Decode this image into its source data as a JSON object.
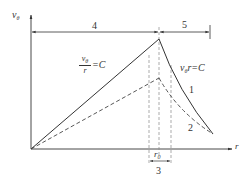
{
  "diagram": {
    "axes": {
      "y_label": "v",
      "y_label_sub": "θ",
      "x_label": "r"
    },
    "dimensions": {
      "left_zone_label": "4",
      "right_zone_label": "5",
      "core_zone_label": "3",
      "core_radius_label": "r",
      "core_radius_sub": "0"
    },
    "equations": {
      "forced_vortex": {
        "numerator": "v",
        "numerator_sub": "θ",
        "denominator": "r",
        "rhs": "=C"
      },
      "free_vortex": {
        "lhs": "v",
        "lhs_sub": "θ",
        "rhs": "r=C"
      }
    },
    "curves": {
      "curve_1_label": "1",
      "curve_2_label": "2"
    },
    "colors": {
      "line": "#333333",
      "dashed": "#555555",
      "guide": "#888888"
    }
  }
}
